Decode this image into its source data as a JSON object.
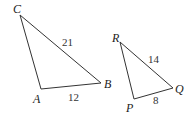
{
  "diagram": {
    "triangles": [
      {
        "name": "ABC",
        "vertices": {
          "A": "A",
          "B": "B",
          "C": "C"
        },
        "sides": {
          "CB": "21",
          "AB": "12"
        }
      },
      {
        "name": "PQR",
        "vertices": {
          "P": "P",
          "Q": "Q",
          "R": "R"
        },
        "sides": {
          "RQ": "14",
          "PQ": "8"
        }
      }
    ],
    "stroke_color": "#333333"
  }
}
